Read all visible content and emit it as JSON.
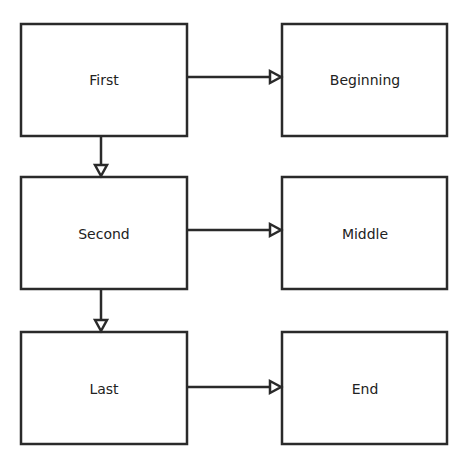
{
  "diagram": {
    "stroke_color": "#2a2a2a",
    "nodes": [
      {
        "id": "first",
        "label": "First"
      },
      {
        "id": "beginning",
        "label": "Beginning"
      },
      {
        "id": "second",
        "label": "Second"
      },
      {
        "id": "middle",
        "label": "Middle"
      },
      {
        "id": "last",
        "label": "Last"
      },
      {
        "id": "end",
        "label": "End"
      }
    ],
    "edges": [
      {
        "from": "First",
        "to": "Beginning"
      },
      {
        "from": "First",
        "to": "Second"
      },
      {
        "from": "Second",
        "to": "Middle"
      },
      {
        "from": "Second",
        "to": "Last"
      },
      {
        "from": "Last",
        "to": "End"
      }
    ]
  }
}
